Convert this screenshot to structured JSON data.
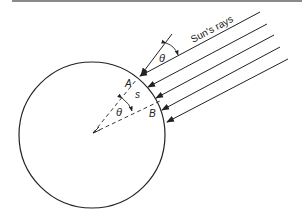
{
  "diagram": {
    "title_label": "Sun's rays",
    "labels": {
      "angle_outer": "θ",
      "angle_inner": "θ",
      "point_a": "A",
      "point_b": "B",
      "arc_length": "s"
    },
    "colors": {
      "stroke": "#222222",
      "top_rule": "#8a8a8a",
      "background": "#ffffff"
    },
    "ray_count": 5
  }
}
